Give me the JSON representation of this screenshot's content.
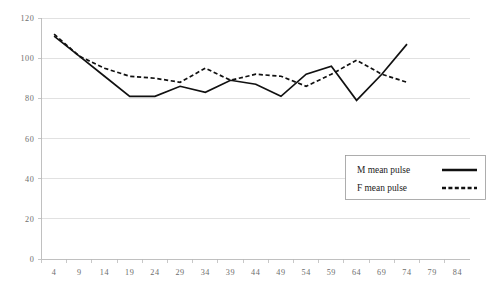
{
  "chart_data": {
    "type": "line",
    "title": "",
    "subtitle": "",
    "xlabel": "",
    "ylabel": "",
    "xlim": [
      4,
      84
    ],
    "ylim": [
      0,
      120
    ],
    "yticks": [
      0,
      20,
      40,
      60,
      80,
      100,
      120
    ],
    "xticks": [
      4,
      9,
      14,
      19,
      24,
      29,
      34,
      39,
      44,
      49,
      54,
      59,
      64,
      69,
      74,
      79,
      84
    ],
    "grid": true,
    "legend_position": "bottom-right",
    "x": [
      4,
      9,
      14,
      19,
      24,
      29,
      34,
      39,
      44,
      49,
      54,
      59,
      64,
      69,
      74
    ],
    "series": [
      {
        "name": "M mean pulse",
        "style": "solid",
        "color": "#111111",
        "values": [
          111,
          101,
          91,
          81,
          81,
          86,
          83,
          89,
          87,
          81,
          92,
          96,
          79,
          92,
          107
        ]
      },
      {
        "name": "F mean pulse",
        "style": "dashed",
        "color": "#111111",
        "values": [
          112,
          101,
          95,
          91,
          90,
          88,
          95,
          89,
          92,
          91,
          86,
          92,
          99,
          92,
          88
        ]
      }
    ]
  },
  "legend": {
    "entries": [
      {
        "label": "M mean pulse",
        "style": "solid"
      },
      {
        "label": "F mean pulse",
        "style": "dashed"
      }
    ]
  },
  "axes": {
    "y_tick_labels": [
      "120",
      "100",
      "80",
      "60",
      "40",
      "20",
      "0"
    ],
    "x_tick_labels": [
      "4",
      "9",
      "14",
      "19",
      "24",
      "29",
      "34",
      "39",
      "44",
      "49",
      "54",
      "59",
      "64",
      "69",
      "74",
      "79",
      "84"
    ]
  },
  "colors": {
    "series": "#111111",
    "gridline": "#d9d9d9",
    "axis": "#b9b9b9",
    "tick_text": "#6e6e6e",
    "legend_border": "#9a9a9a",
    "background": "#ffffff"
  }
}
